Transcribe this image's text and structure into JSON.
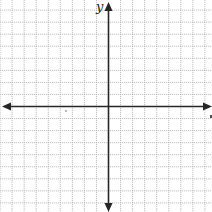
{
  "diagram": {
    "type": "coordinate-plane",
    "labels": {
      "y_axis": "y",
      "x_axis": "x"
    },
    "grid": {
      "cell_px": 12.05,
      "origin_px": [
        108.5,
        106.5
      ],
      "line_color": "#b8b8b8",
      "axis_color": "#262626",
      "background": "#ffffff"
    }
  }
}
